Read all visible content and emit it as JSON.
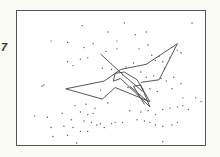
{
  "figure": {
    "panel_label": "7",
    "colors": {
      "frame": "#555555",
      "line": "#444444",
      "dot": "#555555",
      "background": "#ffffff"
    }
  },
  "chart_data": {
    "type": "scatter",
    "title": "",
    "xlabel": "",
    "ylabel": "",
    "xlim": [
      0,
      100
    ],
    "ylim": [
      0,
      100
    ],
    "grid": false,
    "points": [
      [
        34,
        9
      ],
      [
        57,
        7
      ],
      [
        63,
        16
      ],
      [
        69,
        14
      ],
      [
        94,
        7
      ],
      [
        48,
        14
      ],
      [
        53,
        21
      ],
      [
        17,
        21
      ],
      [
        26,
        22
      ],
      [
        35,
        26
      ],
      [
        40,
        23
      ],
      [
        47,
        29
      ],
      [
        53,
        27
      ],
      [
        65,
        27
      ],
      [
        70,
        24
      ],
      [
        72,
        32
      ],
      [
        74,
        36
      ],
      [
        76,
        33
      ],
      [
        78,
        37
      ],
      [
        79,
        42
      ],
      [
        82,
        34
      ],
      [
        86,
        28
      ],
      [
        88,
        30
      ],
      [
        26,
        37
      ],
      [
        29,
        40
      ],
      [
        33,
        35
      ],
      [
        37,
        34
      ],
      [
        45,
        42
      ],
      [
        50,
        43
      ],
      [
        56,
        47
      ],
      [
        58,
        41
      ],
      [
        62,
        38
      ],
      [
        66,
        45
      ],
      [
        69,
        49
      ],
      [
        73,
        48
      ],
      [
        77,
        50
      ],
      [
        80,
        52
      ],
      [
        84,
        49
      ],
      [
        88,
        54
      ],
      [
        12,
        56
      ],
      [
        13,
        55
      ],
      [
        44,
        59
      ],
      [
        59,
        57
      ],
      [
        67,
        58
      ],
      [
        71,
        58
      ],
      [
        75,
        60
      ],
      [
        83,
        58
      ],
      [
        89,
        65
      ],
      [
        96,
        65
      ],
      [
        99,
        68
      ],
      [
        48,
        69
      ],
      [
        36,
        70
      ],
      [
        41,
        73
      ],
      [
        30,
        71
      ],
      [
        33,
        76
      ],
      [
        37,
        78
      ],
      [
        40,
        77
      ],
      [
        60,
        75
      ],
      [
        66,
        76
      ],
      [
        70,
        75
      ],
      [
        74,
        78
      ],
      [
        78,
        74
      ],
      [
        82,
        73
      ],
      [
        86,
        72
      ],
      [
        89,
        71
      ],
      [
        23,
        77
      ],
      [
        28,
        82
      ],
      [
        35,
        83
      ],
      [
        39,
        84
      ],
      [
        44,
        85
      ],
      [
        52,
        84
      ],
      [
        56,
        84
      ],
      [
        64,
        82
      ],
      [
        68,
        83
      ],
      [
        71,
        84
      ],
      [
        74,
        86
      ],
      [
        78,
        87
      ],
      [
        83,
        86
      ],
      [
        86,
        84
      ],
      [
        8,
        79
      ],
      [
        15,
        80
      ],
      [
        17,
        88
      ],
      [
        24,
        87
      ],
      [
        29,
        88
      ],
      [
        33,
        91
      ],
      [
        26,
        94
      ],
      [
        18,
        95
      ],
      [
        37,
        91
      ],
      [
        42,
        86
      ],
      [
        46,
        88
      ],
      [
        50,
        85
      ],
      [
        31,
        100
      ],
      [
        78,
        99
      ],
      [
        92,
        74
      ]
    ],
    "crane_lines": [
      [
        [
          25,
          58
        ],
        [
          46,
          52
        ]
      ],
      [
        [
          46,
          52
        ],
        [
          55,
          43
        ]
      ],
      [
        [
          55,
          43
        ],
        [
          69,
          39
        ]
      ],
      [
        [
          69,
          39
        ],
        [
          86,
          23
        ]
      ],
      [
        [
          86,
          23
        ],
        [
          76,
          51
        ]
      ],
      [
        [
          76,
          51
        ],
        [
          66,
          53
        ]
      ],
      [
        [
          25,
          58
        ],
        [
          45,
          66
        ]
      ],
      [
        [
          45,
          66
        ],
        [
          52,
          57
        ]
      ],
      [
        [
          52,
          57
        ],
        [
          71,
          68
        ]
      ],
      [
        [
          71,
          68
        ],
        [
          64,
          51
        ]
      ],
      [
        [
          64,
          51
        ],
        [
          57,
          45
        ]
      ],
      [
        [
          57,
          45
        ],
        [
          52,
          46
        ]
      ],
      [
        [
          52,
          46
        ],
        [
          51,
          52
        ]
      ],
      [
        [
          51,
          52
        ],
        [
          55,
          50
        ]
      ],
      [
        [
          55,
          50
        ],
        [
          71,
          72
        ]
      ],
      [
        [
          71,
          72
        ],
        [
          66,
          55
        ]
      ],
      [
        [
          66,
          55
        ],
        [
          62,
          56
        ]
      ],
      [
        [
          62,
          56
        ],
        [
          68,
          70
        ]
      ],
      [
        [
          44,
          31
        ],
        [
          57,
          48
        ]
      ],
      [
        [
          57,
          48
        ],
        [
          67,
          60
        ]
      ],
      [
        [
          60,
          56
        ],
        [
          70,
          68
        ]
      ]
    ]
  }
}
